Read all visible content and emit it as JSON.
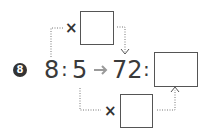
{
  "problem": {
    "number": "8",
    "left_ratio": {
      "a": "8",
      "b": "5"
    },
    "right_ratio": {
      "a": "72",
      "b": ""
    },
    "top_multiplier": {
      "symbol": "×",
      "value": ""
    },
    "bottom_multiplier": {
      "symbol": "×",
      "value": ""
    },
    "colon": ":",
    "arrow_icon": "right-arrow-icon"
  },
  "colors": {
    "text": "#3a3a3a",
    "arrow": "#9a9a9a",
    "dotted": "#777777",
    "badge": "#333333"
  }
}
